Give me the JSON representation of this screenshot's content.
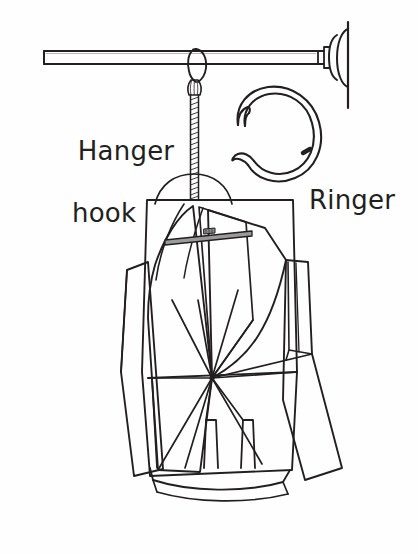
{
  "figure": {
    "background_color": "#fefefe",
    "line_color": "#231f20",
    "width": 418,
    "height": 554
  },
  "labels": {
    "hanger_hook": {
      "line1": "Hanger",
      "line2": "hook",
      "color": "#231f20"
    },
    "ringer": {
      "text": "Ringer",
      "color": "#231f20"
    }
  },
  "parts": {
    "wall_rail": "horizontal-rail",
    "wall_flange": "wall-mount-disc",
    "hook_loop": "s-hook-over-rail",
    "swivel": "swivel-clasp",
    "cord": "coiled-cord",
    "hanger_dome": "hanger-top-arc",
    "ringer_ring": "open-split-ring",
    "ringer_notch": "ring-gap-marker",
    "garment_stack": "pattern-piece-stack",
    "label_tag": "garment-label-tag",
    "radiating_point": "seam-convergence-point"
  }
}
